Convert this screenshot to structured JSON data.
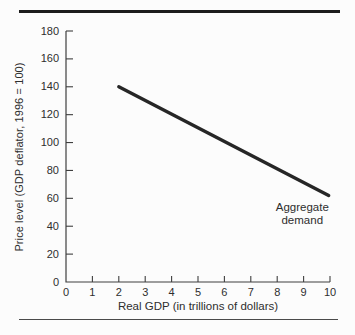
{
  "figure": {
    "background": "#fcfcfc"
  },
  "chart_data": {
    "type": "line",
    "title": "",
    "xlabel": "Real GDP (in trillions of dollars)",
    "ylabel": "Price level (GDP deflator, 1996 = 100)",
    "xlim": [
      0,
      10
    ],
    "ylim": [
      0,
      180
    ],
    "x_ticks": [
      0,
      1,
      2,
      3,
      4,
      5,
      6,
      7,
      8,
      9,
      10
    ],
    "y_ticks": [
      0,
      20,
      40,
      60,
      80,
      100,
      120,
      140,
      160,
      180
    ],
    "grid": false,
    "legend_position": "none",
    "series": [
      {
        "name": "Aggregate demand",
        "x": [
          2,
          9.95
        ],
        "y": [
          140,
          62
        ],
        "color": "#262626",
        "stroke_width": 3.4
      }
    ],
    "annotation": {
      "line1": "Aggregate",
      "line2": "demand",
      "x": 8.95,
      "y": 49
    },
    "colors": {
      "axis": "#3f3f3f",
      "text": "#2e2e2e",
      "top_rule": "#1d1d1d",
      "bottom_rule": "#4a4a4a"
    }
  }
}
